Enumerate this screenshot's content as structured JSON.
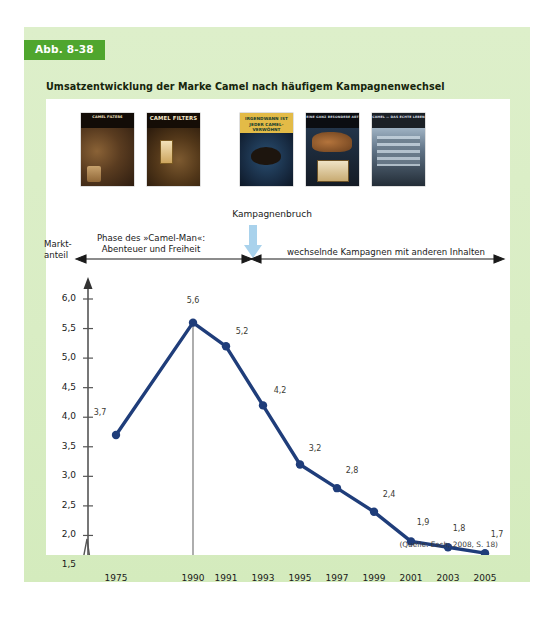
{
  "figure": {
    "badge": "Abb. 8-38",
    "caption": "Umsatzentwicklung der Marke Camel nach häufigem Kampagnenwechsel",
    "source_note": "(Quelle: Esch, 2008, S. 18)"
  },
  "ads": [
    {
      "name": "camel-filters-ad-1",
      "headline": "CAMEL FILTERS"
    },
    {
      "name": "camel-filters-ad-2",
      "headline": "CAMEL FILTERS",
      "subline": "It's a whole new world."
    },
    {
      "name": "camel-ad-3",
      "headline": "IRGENDWANN IST JEDER CAMEL-VERWÖHNT"
    },
    {
      "name": "camel-ad-4",
      "headline": "EINE GANZ BESONDERE ART"
    },
    {
      "name": "camel-ad-5",
      "headline": "CAMEL — DAS ECHTE LEBEN"
    }
  ],
  "annotations": {
    "break_label": "Kampagnenbruch",
    "phase_left": "Phase des »Camel-Man«:\nAbenteuer und Freiheit",
    "phase_left_line1": "Phase des »Camel-Man«:",
    "phase_left_line2": "Abenteuer und Freiheit",
    "phase_right": "wechselnde Kampagnen mit anderen Inhalten",
    "axis_title_line1": "Markt-",
    "axis_title_line2": "anteil",
    "arrow_color": "#a9d2ec"
  },
  "chart_data": {
    "type": "line",
    "title": "Umsatzentwicklung der Marke Camel nach häufigem Kampagnenwechsel",
    "xlabel": "",
    "ylabel": "Marktanteil",
    "x": [
      "1975",
      "1990",
      "1991",
      "1993",
      "1995",
      "1997",
      "1999",
      "2001",
      "2003",
      "2005"
    ],
    "values": [
      3.7,
      5.6,
      5.2,
      4.2,
      3.2,
      2.8,
      2.4,
      1.9,
      1.8,
      1.7
    ],
    "point_labels": [
      "3,7",
      "5,6",
      "5,2",
      "4,2",
      "3,2",
      "2,8",
      "2,4",
      "1,9",
      "1,8",
      "1,7"
    ],
    "ylim": [
      1.5,
      6.0
    ],
    "yticks": [
      6.0,
      5.5,
      5.0,
      4.5,
      4.0,
      3.5,
      3.0,
      2.5,
      2.0,
      1.5
    ],
    "ytick_labels": [
      "6,0",
      "5,5",
      "5,0",
      "4,5",
      "4,0",
      "3,5",
      "3,0",
      "2,5",
      "2,0",
      "1,5"
    ],
    "xtick_labels": [
      "1975",
      "1990",
      "1991",
      "1993",
      "1995",
      "1997",
      "1999",
      "2001",
      "2003",
      "2005"
    ],
    "grid": false,
    "legend": false,
    "axis_break": true,
    "series_color": "#1f3d7a",
    "marker_color": "#1f3d7a",
    "vertical_marker_at": "1990"
  },
  "colors": {
    "badge_bg": "#4fa62e",
    "panel_bg": "#d9edc4",
    "card_bg": "#ffffff",
    "line": "#1f3d7a",
    "arrow": "#a9d2ec",
    "axis": "#555555"
  }
}
